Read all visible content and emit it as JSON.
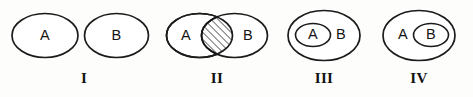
{
  "figure": {
    "name": "set-relation-diagrams",
    "background_color": "#fdfdfc",
    "stroke_color": "#1b1b1b",
    "text_color": "#141414"
  },
  "diagrams": [
    {
      "numeral": "I",
      "relation": "disjoint",
      "labels": {
        "a": "A",
        "b": "B"
      }
    },
    {
      "numeral": "II",
      "relation": "overlapping-with-shaded-intersection",
      "labels": {
        "a": "A",
        "b": "B"
      },
      "shading": "diagonal-hatch"
    },
    {
      "numeral": "III",
      "relation": "a-inside-b",
      "labels": {
        "a": "A",
        "b": "B"
      }
    },
    {
      "numeral": "IV",
      "relation": "b-inside-a",
      "labels": {
        "a": "A",
        "b": "B"
      }
    }
  ]
}
